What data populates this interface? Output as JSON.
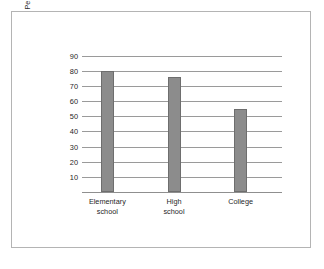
{
  "chart_data": {
    "type": "bar",
    "title": "",
    "xlabel": "",
    "ylabel_lines": [
      "Percentage of children favoring the same",
      "political party as their parents"
    ],
    "categories": [
      "Elementary school",
      "High school",
      "College"
    ],
    "category_lines": [
      [
        "Elementary",
        "school"
      ],
      [
        "High",
        "school"
      ],
      [
        "College"
      ]
    ],
    "values": [
      80,
      76,
      55
    ],
    "ylim": [
      0,
      95
    ],
    "yticks": [
      90,
      80,
      70,
      60,
      50,
      40,
      30,
      20,
      10
    ],
    "grid": true,
    "legend": "none",
    "colors": {
      "bar_fill": "#8c8c8c",
      "bar_stroke": "#6e6e6e",
      "gridline": "#9a9a9a",
      "frame": "#b4b4b4",
      "background": "#ffffff",
      "text": "#1f1f1f"
    }
  }
}
